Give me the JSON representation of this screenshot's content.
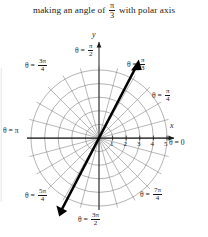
{
  "caption": {
    "before": "making an angle of",
    "fraction": {
      "numerator": "π",
      "denominator": "3"
    },
    "after": "with polar axis"
  },
  "figure": {
    "type": "polar-grid",
    "axis_labels": {
      "x": "x",
      "y": "y"
    },
    "pole_label": "",
    "radial_ticks": [
      "1",
      "2",
      "3",
      "4",
      "5"
    ],
    "circles": 5,
    "spoke_step_degrees": 15,
    "grid_color": "#8a8a8a",
    "axis_color": "#1a1a1a",
    "ray_color": "#000000",
    "angle_labels": [
      {
        "name": "theta-0",
        "theta": "θ = 0",
        "prefix": "θ = ",
        "value": "0",
        "num": "",
        "den": "",
        "deg": 0
      },
      {
        "name": "theta-pi-4",
        "prefix": "θ = ",
        "num": "π",
        "den": "4",
        "deg": 45
      },
      {
        "name": "theta-pi-3",
        "prefix": "θ = ",
        "num": "π",
        "den": "3",
        "deg": 60
      },
      {
        "name": "theta-pi-2",
        "prefix": "θ = ",
        "num": "π",
        "den": "2",
        "deg": 90
      },
      {
        "name": "theta-3pi-4",
        "prefix": "θ = ",
        "num": "3π",
        "den": "4",
        "deg": 135
      },
      {
        "name": "theta-pi",
        "prefix": "θ = ",
        "value": "π",
        "num": "",
        "den": "",
        "deg": 180
      },
      {
        "name": "theta-5pi-4",
        "prefix": "θ = ",
        "num": "5π",
        "den": "4",
        "deg": 225
      },
      {
        "name": "theta-3pi-2",
        "prefix": "θ = ",
        "num": "3π",
        "den": "2",
        "deg": 270
      },
      {
        "name": "theta-7pi-4",
        "prefix": "θ = ",
        "num": "7π",
        "den": "4",
        "deg": 315
      }
    ],
    "highlight_ray": {
      "angle_degrees": 60,
      "label_num": "π",
      "label_den": "3",
      "double_headed": true
    }
  }
}
